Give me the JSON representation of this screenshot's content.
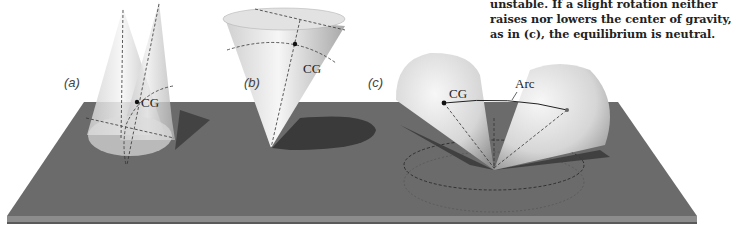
{
  "caption": {
    "lines": [
      "unstable. If a slight rotation neither",
      "raises nor lowers the center of gravity,",
      "as in (c), the equilibrium is neutral."
    ]
  },
  "panels": {
    "a": {
      "label": "(a)",
      "cg_label": "CG"
    },
    "b": {
      "label": "(b)",
      "cg_label": "CG"
    },
    "c": {
      "label": "(c)",
      "cg_label": "CG",
      "arc_label": "Arc"
    }
  },
  "colors": {
    "board_top": "#6b6b6b",
    "board_edge": "#8a8a8a",
    "cone_light": "#f2f2f2",
    "cone_dark": "#9a9a9a",
    "shadow": "#3e3e3e"
  }
}
